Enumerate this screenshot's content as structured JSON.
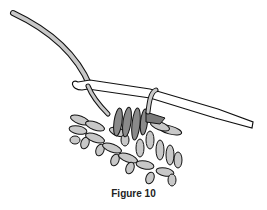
{
  "figure": {
    "caption": "Figure 10",
    "colors": {
      "yarn": "#c8c8c8",
      "yarn_dark": "#8a8a8a",
      "yarn_mid": "#7a7a7a",
      "outline": "#111111",
      "hook": "#ffffff"
    }
  }
}
